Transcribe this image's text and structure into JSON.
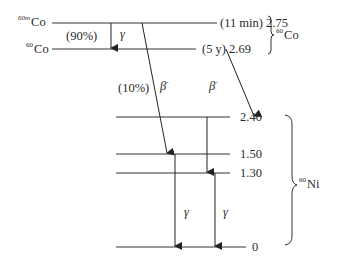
{
  "diagram": {
    "type": "nuclear decay scheme",
    "parent_levels": [
      {
        "nuclide_mass": "60m",
        "element": "Co",
        "half_life": "(11 min)",
        "energy_MeV": "2.75"
      },
      {
        "nuclide_mass": "60",
        "element": "Co",
        "half_life": "(5 y)",
        "energy_MeV": "2.69"
      }
    ],
    "parent_group": {
      "mass": "60",
      "element": "Co"
    },
    "daughter_levels": [
      {
        "energy_MeV": "2.40"
      },
      {
        "energy_MeV": "1.50"
      },
      {
        "energy_MeV": "1.30"
      },
      {
        "energy_MeV": "0"
      }
    ],
    "daughter_group": {
      "mass": "60",
      "element": "Ni"
    },
    "transitions": [
      {
        "from": "2.75",
        "to": "2.69",
        "type": "gamma",
        "symbol": "γ",
        "branch": "(90%)"
      },
      {
        "from": "2.75",
        "to": "1.50",
        "type": "beta-minus",
        "symbol": "β",
        "sup": "-",
        "branch": "(10%)"
      },
      {
        "from": "2.69",
        "to": "2.40",
        "type": "beta-minus",
        "symbol": "β",
        "sup": "-"
      },
      {
        "from": "2.40",
        "to": "1.30",
        "type": "gamma"
      },
      {
        "from": "1.50",
        "to": "0",
        "type": "gamma",
        "symbol": "γ"
      },
      {
        "from": "1.30",
        "to": "0",
        "type": "gamma",
        "symbol": "γ"
      }
    ]
  }
}
